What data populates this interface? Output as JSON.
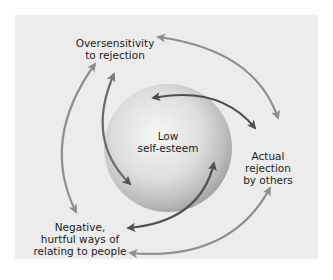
{
  "diagram": {
    "type": "cycle",
    "center": {
      "label": "Low\nself-esteem"
    },
    "nodes": [
      {
        "id": "oversensitivity",
        "label": "Oversensitivity\nto rejection",
        "position": "top-left"
      },
      {
        "id": "actual-rejection",
        "label": "Actual\nrejection\nby others",
        "position": "right"
      },
      {
        "id": "negative-ways",
        "label": "Negative,\nhurtful ways of\nrelating to people",
        "position": "bottom-left"
      }
    ],
    "arrows": [
      {
        "from": "oversensitivity",
        "to": "actual-rejection",
        "direction": "bidirectional",
        "style": "outer"
      },
      {
        "from": "actual-rejection",
        "to": "negative-ways",
        "direction": "bidirectional",
        "style": "outer"
      },
      {
        "from": "negative-ways",
        "to": "oversensitivity",
        "direction": "bidirectional",
        "style": "outer"
      },
      {
        "from": "center",
        "to": "actual-rejection",
        "direction": "bidirectional",
        "style": "inner"
      },
      {
        "from": "center",
        "to": "negative-ways",
        "direction": "bidirectional",
        "style": "inner"
      },
      {
        "from": "center",
        "to": "oversensitivity",
        "direction": "bidirectional",
        "style": "inner"
      }
    ],
    "colors": {
      "panel": "#ececec",
      "outer_arrow": "#8e8e8e",
      "inner_arrow": "#555555",
      "sphere_light": "#f4f4f4",
      "sphere_dark": "#a9a9a9",
      "text": "#1c1c1c"
    }
  }
}
